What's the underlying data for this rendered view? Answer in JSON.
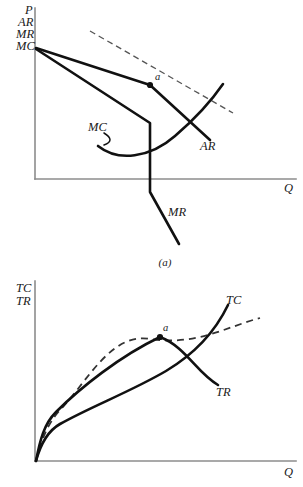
{
  "figure": {
    "background_color": "#ffffff",
    "ink_color": "#111111",
    "axis_color": "#8c8c8c",
    "dash_color": "#555555",
    "width": 303,
    "height": 487
  },
  "panel_a": {
    "caption": "(a)",
    "caption_pos": {
      "x": 165,
      "y": 266
    },
    "y_axis_labels": [
      {
        "text": "P",
        "x": 25,
        "y": 14
      },
      {
        "text": "AR",
        "x": 18,
        "y": 26
      },
      {
        "text": "MR",
        "x": 16,
        "y": 38
      },
      {
        "text": "MC",
        "x": 16,
        "y": 50
      }
    ],
    "x_axis_label": {
      "text": "Q",
      "x": 284,
      "y": 192
    },
    "axis": {
      "y_axis": "M 35 8 L 35 179",
      "x_axis": "M 35 179 L 296 179"
    },
    "curves": [
      {
        "name": "ar-upper-segment",
        "label": "AR",
        "label_pos": {
          "x": 200,
          "y": 150
        },
        "path": "M 36 48 L 150 85 L 210 140"
      },
      {
        "name": "mr-kinked",
        "label": "MR",
        "label_pos": {
          "x": 168,
          "y": 216
        },
        "path": "M 36 49 L 150 123 L 150 192 L 179 244"
      },
      {
        "name": "mc-curve",
        "label": "MC",
        "label_pos": {
          "x": 88,
          "y": 131
        },
        "path": "M 98 146 C 118 162, 150 158, 175 136 C 196 118, 212 100, 223 84"
      },
      {
        "name": "tangent-dashed",
        "label": "",
        "path": "M 90 31 L 233 113"
      }
    ],
    "leader_line": {
      "name": "mc-leader",
      "path": "M 104 133 C 112 138, 112 142, 104 145"
    },
    "point": {
      "label": "a",
      "x": 150,
      "y": 85,
      "label_x": 155,
      "label_y": 80,
      "radius": 3.1
    }
  },
  "panel_b": {
    "caption": "",
    "y_axis_labels": [
      {
        "text": "TC",
        "x": 16,
        "y": 292
      },
      {
        "text": "TR",
        "x": 16,
        "y": 305
      }
    ],
    "x_axis_label": {
      "text": "Q",
      "x": 284,
      "y": 476
    },
    "axis": {
      "y_axis": "M 35 281 L 35 461",
      "x_axis": "M 35 461 L 296 461"
    },
    "curves": [
      {
        "name": "tr-solid",
        "label": "TR",
        "label_pos": {
          "x": 216,
          "y": 396
        },
        "path": "M 36 461 C 40 440, 44 424, 56 412 C 80 388, 120 356, 160 337 C 186 347, 196 372, 218 385"
      },
      {
        "name": "tr-dashed-extension",
        "label": "",
        "path": "M 36 461 C 42 436, 50 420, 62 408 C 88 380, 112 332, 150 339 C 196 346, 226 327, 260 318"
      },
      {
        "name": "tc-solid",
        "label": "TC",
        "label_pos": {
          "x": 226,
          "y": 304
        },
        "path": "M 36 461 C 40 446, 46 432, 60 424 C 92 406, 130 392, 166 371 C 196 353, 216 330, 228 305"
      }
    ],
    "point": {
      "label": "a",
      "x": 160,
      "y": 337,
      "label_x": 163,
      "label_y": 331,
      "radius": 3.1
    }
  }
}
